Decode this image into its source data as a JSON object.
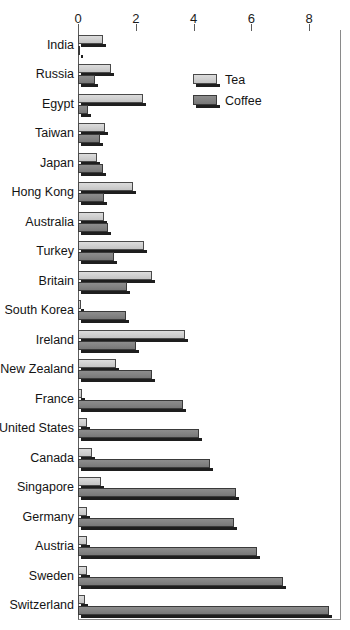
{
  "chart_data": {
    "type": "bar",
    "orientation": "horizontal",
    "title": "",
    "xlabel": "",
    "ylabel": "",
    "xlim": [
      0,
      9.1
    ],
    "xticks": [
      0,
      2,
      4,
      6,
      8
    ],
    "xtick_labels": [
      "0",
      "2",
      "4",
      "6",
      "8"
    ],
    "grid": false,
    "legend_position": "upper right inside",
    "categories": [
      "India",
      "Russia",
      "Egypt",
      "Taiwan",
      "Japan",
      "Hong Kong",
      "Australia",
      "Turkey",
      "Britain",
      "South Korea",
      "Ireland",
      "New Zealand",
      "France",
      "United States",
      "Canada",
      "Singapore",
      "Germany",
      "Austria",
      "Sweden",
      "Switzerland"
    ],
    "series": [
      {
        "name": "Tea",
        "color": "#cfcfcf",
        "values": [
          0.85,
          1.15,
          2.25,
          0.95,
          0.65,
          1.9,
          0.9,
          2.3,
          2.55,
          0.1,
          3.7,
          1.3,
          0.15,
          0.3,
          0.5,
          0.8,
          0.3,
          0.3,
          0.3,
          0.25
        ]
      },
      {
        "name": "Coffee",
        "color": "#828282",
        "values": [
          0.05,
          0.6,
          0.35,
          0.75,
          0.85,
          0.9,
          1.05,
          1.25,
          1.7,
          1.65,
          2.0,
          2.55,
          3.65,
          4.2,
          4.55,
          5.45,
          5.4,
          6.2,
          7.1,
          8.7
        ]
      }
    ]
  },
  "legend": {
    "items": [
      {
        "label": "Tea"
      },
      {
        "label": "Coffee"
      }
    ]
  }
}
